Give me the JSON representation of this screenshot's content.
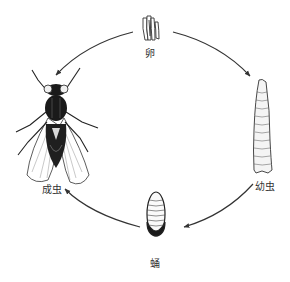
{
  "diagram": {
    "stages": [
      {
        "id": "egg",
        "label": "卵"
      },
      {
        "id": "larva",
        "label": "幼虫"
      },
      {
        "id": "pupa",
        "label": "蛹"
      },
      {
        "id": "adult",
        "label": "成虫"
      }
    ],
    "edges": [
      {
        "from": "egg",
        "to": "larva"
      },
      {
        "from": "larva",
        "to": "pupa"
      },
      {
        "from": "pupa",
        "to": "adult"
      },
      {
        "from": "adult",
        "to": "egg"
      }
    ],
    "colors": {
      "line": "#333333",
      "fill_dark": "#1a1a1a",
      "background": "#ffffff"
    }
  }
}
